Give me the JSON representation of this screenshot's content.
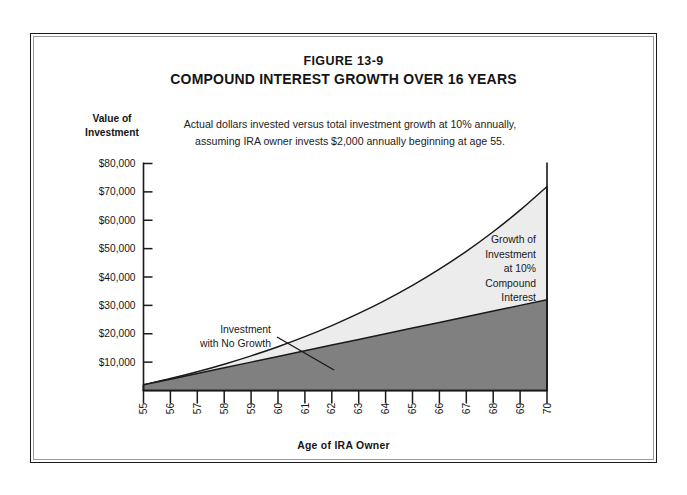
{
  "figure": {
    "number": "FIGURE 13-9",
    "title": "COMPOUND INTEREST GROWTH OVER 16 YEARS",
    "subtitle_line1": "Actual dollars invested versus total investment growth at 10% annually,",
    "subtitle_line2": "assuming IRA owner invests $2,000 annually beginning at age 55."
  },
  "axes": {
    "y_caption_line1": "Value of",
    "y_caption_line2": "Investment",
    "x_caption": "Age of IRA Owner",
    "y_tick_labels": [
      "$80,000",
      "$70,000",
      "$60,000",
      "$50,000",
      "$40,000",
      "$30,000",
      "$20,000",
      "$10,000"
    ],
    "x_tick_labels": [
      "55",
      "56",
      "57",
      "58",
      "59",
      "60",
      "61",
      "62",
      "63",
      "64",
      "65",
      "66",
      "67",
      "68",
      "69",
      "70"
    ]
  },
  "annotations": {
    "growth_line1": "Growth of",
    "growth_line2": "Investment",
    "growth_line3": "at 10%",
    "growth_line4": "Compound",
    "growth_line5": "Interest",
    "nogrowth_line1": "Investment",
    "nogrowth_line2": "with No Growth"
  },
  "colors": {
    "growth_fill": "#ececec",
    "principal_fill": "#808080",
    "stroke": "#1a1a1a",
    "frame": "#1a1a1a",
    "background": "#ffffff"
  },
  "chart_data": {
    "type": "area",
    "title": "COMPOUND INTEREST GROWTH OVER 16 YEARS",
    "subtitle": "Actual dollars invested versus total investment growth at 10% annually, assuming IRA owner invests $2,000 annually beginning at age 55.",
    "xlabel": "Age of IRA Owner",
    "ylabel": "Value of Investment",
    "x": [
      55,
      56,
      57,
      58,
      59,
      60,
      61,
      62,
      63,
      64,
      65,
      66,
      67,
      68,
      69,
      70
    ],
    "xlim": [
      55,
      70
    ],
    "ylim": [
      0,
      85000
    ],
    "grid": false,
    "legend": "none",
    "stacked": false,
    "series": [
      {
        "name": "Investment with No Growth",
        "fill": "#808080",
        "values": [
          2000,
          4000,
          6000,
          8000,
          10000,
          12000,
          14000,
          16000,
          18000,
          20000,
          22000,
          24000,
          26000,
          28000,
          30000,
          32000
        ]
      },
      {
        "name": "Growth of Investment at 10% Compound Interest",
        "fill": "#ececec",
        "values": [
          2000,
          4200,
          6620,
          9282,
          12210,
          15431,
          18974,
          22872,
          27159,
          31875,
          37062,
          42769,
          49045,
          55950,
          63545,
          71899
        ]
      }
    ]
  }
}
